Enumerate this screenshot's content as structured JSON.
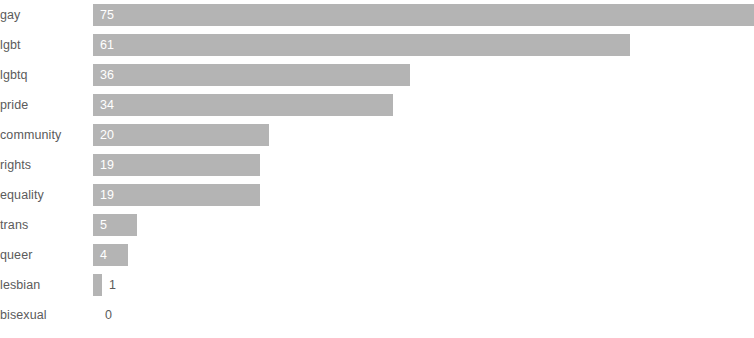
{
  "chart_data": {
    "type": "bar",
    "orientation": "horizontal",
    "title": "",
    "subtitle": "",
    "xlabel": "",
    "ylabel": "",
    "grid": false,
    "legend": null,
    "legend_position": "none",
    "axis_visible": false,
    "tick_labels_x": [],
    "xlim": [
      0,
      75
    ],
    "categories": [
      "gay",
      "lgbt",
      "lgbtq",
      "pride",
      "community",
      "rights",
      "equality",
      "trans",
      "queer",
      "lesbian",
      "bisexual"
    ],
    "values": [
      75,
      61,
      36,
      34,
      20,
      19,
      19,
      5,
      4,
      1,
      0
    ],
    "value_labels": [
      "75",
      "61",
      "36",
      "34",
      "20",
      "19",
      "19",
      "5",
      "4",
      "1",
      "0"
    ],
    "label_placement": [
      "inside",
      "inside",
      "inside",
      "inside",
      "inside",
      "inside",
      "inside",
      "inside",
      "inside",
      "outside",
      "outside"
    ]
  },
  "style": {
    "bar_color": "#b4b4b4",
    "background_color": "#ffffff",
    "category_label_color": "#5b5b5b",
    "value_label_inside_color": "#ffffff",
    "value_label_outside_color": "#5b5b5b"
  }
}
